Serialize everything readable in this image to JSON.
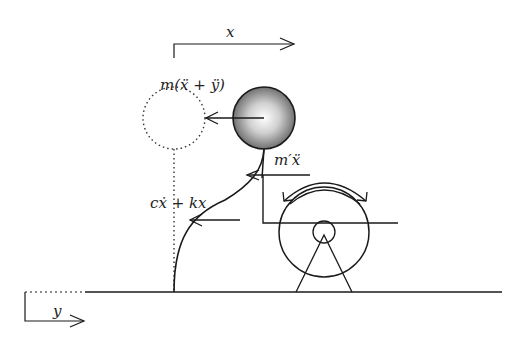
{
  "labels": {
    "x_axis": "x",
    "y_axis": "y",
    "inertia_force": "m(ẍ + ÿ)",
    "exciter_force": "m′ẍ",
    "spring_damper_force": "cẋ + kx"
  },
  "colors": {
    "stroke": "#1a1a1a",
    "ball_highlight": "#ffffff",
    "ball_shadow": "#6b6b6b"
  }
}
